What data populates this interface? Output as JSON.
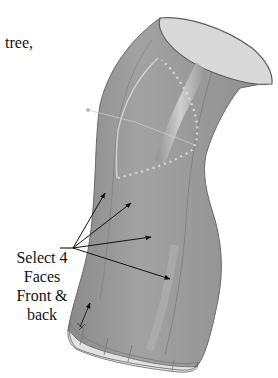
{
  "figure": {
    "caption_fragment": "tree,",
    "callout": {
      "lines": [
        "Select 4",
        "Faces",
        "Front &",
        "back"
      ],
      "arrow_count": 4
    },
    "colors": {
      "body": "#9a9a9a",
      "body_dark": "#7d7d7d",
      "opening": "#d9d9d9",
      "edge": "#5a5a5a",
      "highlight": "#c4c4c4",
      "bottom_band": "#e2e2e2",
      "arrow": "#111111",
      "guide_dots": "#d0d0d0"
    }
  }
}
